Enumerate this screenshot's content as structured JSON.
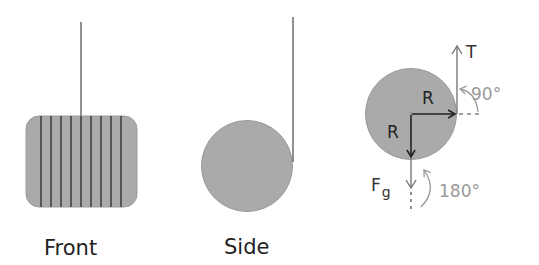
{
  "colors": {
    "fill": "#aaaaaa",
    "stroke_dark": "#333333",
    "stroke_gray": "#8a8a8a",
    "label_gray": "#9a9a9a",
    "string": "#555555",
    "background": "#ffffff"
  },
  "front_view": {
    "label": "Front",
    "stripe_count": 9
  },
  "side_view": {
    "label": "Side"
  },
  "force_diagram": {
    "tension_label": "T",
    "radius_label_right": "R",
    "radius_label_down": "R",
    "gravity_label": "F",
    "gravity_subscript": "g",
    "angle_tension": "90°",
    "angle_gravity": "180°"
  }
}
